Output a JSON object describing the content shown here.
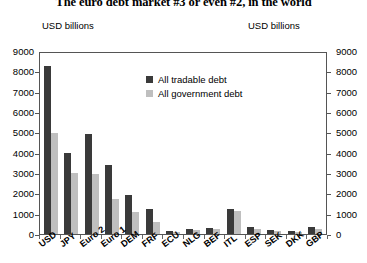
{
  "chart_data": {
    "type": "bar",
    "title": "The euro debt market #3 or even #2, in the world",
    "xlabel": "",
    "ylabel": "USD billions",
    "ylabel_right": "USD billions",
    "ylim": [
      0,
      9000
    ],
    "ytick_step": 1000,
    "yticks": [
      "9000",
      "8000",
      "7000",
      "6000",
      "5000",
      "4000",
      "3000",
      "2000",
      "1000",
      "0"
    ],
    "grid": false,
    "legend_position": "inside-top-center",
    "categories": [
      "USD",
      "JPY",
      "Euro 2",
      "Euro 1",
      "DEM",
      "FRF",
      "ECU",
      "NLG",
      "BEF",
      "ITL",
      "ESP",
      "SEK",
      "DKK",
      "GBP"
    ],
    "series": [
      {
        "name": "All tradable debt",
        "color": "#3a3a3a",
        "values": [
          8250,
          4000,
          4900,
          3400,
          1900,
          1250,
          150,
          250,
          300,
          1250,
          350,
          200,
          130,
          330
        ]
      },
      {
        "name": "All government debt",
        "color": "#bfbfbf",
        "values": [
          4950,
          3000,
          2950,
          1700,
          1100,
          600,
          100,
          180,
          270,
          1150,
          260,
          170,
          110,
          230
        ]
      }
    ]
  },
  "captions": {
    "left": "USD billions",
    "right": "USD billions"
  }
}
